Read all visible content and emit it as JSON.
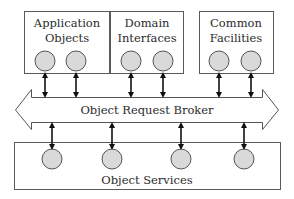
{
  "diagram": {
    "top_boxes": [
      {
        "id": "application-objects",
        "line1": "Application",
        "line2": "Objects",
        "circles": 2
      },
      {
        "id": "domain-interfaces",
        "line1": "Domain",
        "line2": "Interfaces",
        "circles": 2
      },
      {
        "id": "common-facilities",
        "line1": "Common",
        "line2": "Facilities",
        "circles": 2
      }
    ],
    "broker": {
      "label": "Object Request Broker",
      "shape": "double-headed-arrow"
    },
    "bottom_box": {
      "id": "object-services",
      "label": "Object Services",
      "circles": 4
    },
    "connections": "bidirectional arrows between each circle and the Object Request Broker",
    "colors": {
      "circle_fill": "#d9d9d9",
      "outline": "#555555",
      "arrow": "#111111",
      "background": "#ffffff"
    }
  }
}
